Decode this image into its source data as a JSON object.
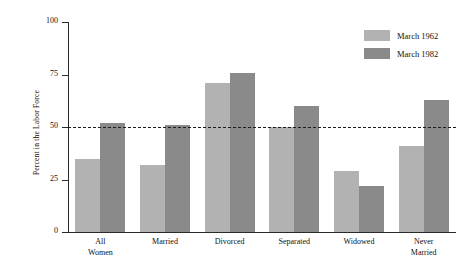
{
  "chart_data": {
    "type": "bar",
    "title": "",
    "xlabel": "",
    "ylabel": "Percent in the Labor Force",
    "ylim": [
      0,
      100
    ],
    "yticks": [
      0,
      25,
      50,
      75,
      100
    ],
    "ytick_labels": [
      "0",
      "25",
      "50",
      "75",
      "100"
    ],
    "grid": false,
    "legend_position": "top-right",
    "reference_line": {
      "value": 50,
      "style": "dashed",
      "label": ""
    },
    "categories": [
      "All Women",
      "Married",
      "Divorced",
      "Separated",
      "Widowed",
      "Never Married"
    ],
    "category_lines": [
      [
        "All",
        "Women"
      ],
      [
        "Married"
      ],
      [
        "Divorced"
      ],
      [
        "Separated"
      ],
      [
        "Widowed"
      ],
      [
        "Never",
        "Married"
      ]
    ],
    "series": [
      {
        "name": "March 1962",
        "color": "#b2b2b2",
        "values": [
          35,
          32,
          71,
          50,
          29,
          41
        ]
      },
      {
        "name": "March 1982",
        "color": "#8a8a8a",
        "values": [
          52,
          51,
          75.5,
          60,
          22,
          63
        ]
      }
    ]
  },
  "legend": {
    "items": [
      {
        "label": "March 1962",
        "color": "#b2b2b2"
      },
      {
        "label": "March 1982",
        "color": "#8a8a8a"
      }
    ]
  },
  "axis": {
    "y_title": "Percent in the Labor Force"
  }
}
